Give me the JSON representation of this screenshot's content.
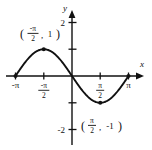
{
  "figure": {
    "title": "",
    "axis_labels": {
      "x": "x",
      "y": "y"
    },
    "y_ticks": [
      {
        "label": "2",
        "value": 2
      },
      {
        "label": "-2",
        "value": -2
      }
    ],
    "x_ticks": [
      {
        "label_whole": "-π",
        "value": -3.14159
      },
      {
        "label_num": "-π",
        "label_den": "2",
        "value": -1.5708
      },
      {
        "label_num": "π",
        "label_den": "2",
        "value": 1.5708
      },
      {
        "label_whole": "π",
        "value": 3.14159
      }
    ],
    "annotations": [
      {
        "open_paren": "(",
        "num": "-π",
        "den": "2",
        "comma": ",",
        "yval": "1",
        "close_paren": ")",
        "point_x": -1.5708,
        "point_y": 1
      },
      {
        "open_paren": "(",
        "num": "π",
        "den": "2",
        "comma": ",",
        "yval": "-1",
        "close_paren": ")",
        "point_x": 1.5708,
        "point_y": -1
      }
    ],
    "marked_points": [
      {
        "x": -3.14159,
        "y": 0
      },
      {
        "x": -1.5708,
        "y": 1
      },
      {
        "x": 1.5708,
        "y": -1
      },
      {
        "x": 3.14159,
        "y": 0
      }
    ],
    "colors": {
      "curve": "#111111",
      "axis": "#111111",
      "background": "#ffffff"
    }
  },
  "chart_data": {
    "type": "line",
    "title": "",
    "xlabel": "x",
    "ylabel": "y",
    "xlim": [
      -3.6,
      3.9
    ],
    "ylim": [
      -2.6,
      2.6
    ],
    "grid": false,
    "legend": null,
    "function": "y = -sin(x)",
    "x_tick_labels": [
      "-π",
      "-π/2",
      "π/2",
      "π"
    ],
    "x_tick_values": [
      -3.14159,
      -1.5708,
      1.5708,
      3.14159
    ],
    "y_tick_labels": [
      "2",
      "-2"
    ],
    "y_tick_values": [
      2,
      -2
    ],
    "series": [
      {
        "name": "y = -sin(x)",
        "x": [
          -3.14159,
          -2.74889,
          -2.35619,
          -1.9635,
          -1.5708,
          -1.1781,
          -0.7854,
          -0.3927,
          0,
          0.3927,
          0.7854,
          1.1781,
          1.5708,
          1.9635,
          2.35619,
          2.74889,
          3.14159
        ],
        "values": [
          0,
          0.38268,
          0.70711,
          0.92388,
          1,
          0.92388,
          0.70711,
          0.38268,
          0,
          -0.38268,
          -0.70711,
          -0.92388,
          -1,
          -0.92388,
          -0.70711,
          -0.38268,
          0
        ]
      }
    ],
    "annotations": [
      {
        "text": "(-π/2, 1)",
        "x": -1.5708,
        "y": 1
      },
      {
        "text": "(π/2, -1)",
        "x": 1.5708,
        "y": -1
      }
    ],
    "marked_points": [
      {
        "x": -3.14159,
        "y": 0
      },
      {
        "x": -1.5708,
        "y": 1
      },
      {
        "x": 1.5708,
        "y": -1
      },
      {
        "x": 3.14159,
        "y": 0
      }
    ]
  }
}
